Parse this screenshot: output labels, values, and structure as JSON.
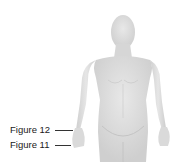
{
  "diagram": {
    "labels": [
      {
        "id": "figure-12",
        "text": "Figure 12",
        "target": "wrist"
      },
      {
        "id": "figure-11",
        "text": "Figure 11",
        "target": "hand"
      }
    ]
  },
  "colors": {
    "background": "#ffffff",
    "body_fill": "#dcdcdc",
    "body_shade": "#c8c8c8",
    "label_text": "#1a1a1a",
    "leader_line": "#333333"
  }
}
